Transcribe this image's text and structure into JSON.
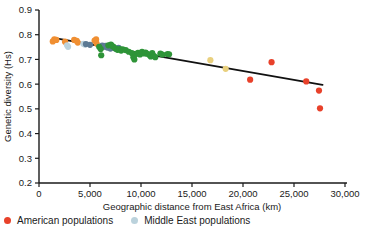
{
  "chart_data": {
    "type": "scatter",
    "title": "",
    "xlabel": "Geographic distance from East Africa (km)",
    "ylabel": "Genetic diversity (Hs)",
    "xlim": [
      0,
      30000
    ],
    "ylim": [
      0.2,
      0.9
    ],
    "grid": false,
    "legend_position": "bottom-left",
    "xticks": [
      0,
      5000,
      10000,
      15000,
      20000,
      25000,
      30000
    ],
    "xtick_labels": [
      "0",
      "5,000",
      "10,000",
      "15,000",
      "20,000",
      "25,000",
      "30,000"
    ],
    "yticks": [
      0.2,
      0.3,
      0.4,
      0.5,
      0.6,
      0.7,
      0.8,
      0.9
    ],
    "ytick_labels": [
      "0.2",
      "0.3",
      "0.4",
      "0.5",
      "0.6",
      "0.7",
      "0.8",
      "0.9"
    ],
    "trendline": {
      "name": "linear regression",
      "color": "#111111",
      "x": [
        1400,
        27800
      ],
      "y": [
        0.787,
        0.597
      ]
    },
    "series": [
      {
        "name": "African populations",
        "color": "#F08F32",
        "points": [
          [
            1350,
            0.773
          ],
          [
            1500,
            0.781
          ],
          [
            1700,
            0.779
          ],
          [
            2550,
            0.772
          ],
          [
            3450,
            0.779
          ],
          [
            3700,
            0.775
          ],
          [
            3800,
            0.768
          ],
          [
            5450,
            0.776
          ],
          [
            5600,
            0.781
          ],
          [
            5650,
            0.764
          ]
        ]
      },
      {
        "name": "Middle East populations",
        "color": "#BBD2DC",
        "points": [
          [
            2750,
            0.757
          ],
          [
            2850,
            0.751
          ],
          [
            4350,
            0.763
          ],
          [
            4500,
            0.76
          ]
        ]
      },
      {
        "name": "European populations",
        "color": "#5C7A94",
        "points": [
          [
            4600,
            0.762
          ],
          [
            5000,
            0.759
          ],
          [
            6200,
            0.756
          ],
          [
            6350,
            0.751
          ],
          [
            6500,
            0.755
          ],
          [
            6700,
            0.748
          ],
          [
            6900,
            0.752
          ],
          [
            7000,
            0.744
          ],
          [
            7200,
            0.749
          ],
          [
            7400,
            0.746
          ],
          [
            7600,
            0.742
          ],
          [
            7800,
            0.747
          ]
        ]
      },
      {
        "name": "Asian populations",
        "color": "#2E9438",
        "points": [
          [
            5900,
            0.751
          ],
          [
            6050,
            0.742
          ],
          [
            6100,
            0.717
          ],
          [
            6800,
            0.757
          ],
          [
            7050,
            0.76
          ],
          [
            7150,
            0.755
          ],
          [
            7300,
            0.751
          ],
          [
            7500,
            0.744
          ],
          [
            7700,
            0.739
          ],
          [
            7900,
            0.742
          ],
          [
            8050,
            0.736
          ],
          [
            8200,
            0.741
          ],
          [
            8500,
            0.738
          ],
          [
            8800,
            0.731
          ],
          [
            9100,
            0.726
          ],
          [
            9250,
            0.709
          ],
          [
            9350,
            0.7
          ],
          [
            9500,
            0.722
          ],
          [
            9700,
            0.727
          ],
          [
            9900,
            0.72
          ],
          [
            10100,
            0.731
          ],
          [
            10300,
            0.724
          ],
          [
            10450,
            0.728
          ],
          [
            10600,
            0.723
          ],
          [
            10800,
            0.719
          ],
          [
            10950,
            0.712
          ],
          [
            11100,
            0.726
          ],
          [
            11250,
            0.714
          ],
          [
            11400,
            0.709
          ],
          [
            11900,
            0.724
          ],
          [
            12100,
            0.72
          ],
          [
            12600,
            0.722
          ],
          [
            12750,
            0.721
          ]
        ]
      },
      {
        "name": "Oceanian populations",
        "color": "#E9D07E",
        "points": [
          [
            16800,
            0.697
          ],
          [
            18300,
            0.662
          ]
        ]
      },
      {
        "name": "American populations",
        "color": "#E8412A",
        "points": [
          [
            20700,
            0.618
          ],
          [
            22800,
            0.689
          ],
          [
            26200,
            0.611
          ],
          [
            27450,
            0.574
          ],
          [
            27550,
            0.502
          ]
        ]
      }
    ]
  },
  "legend": {
    "entries": [
      {
        "label": "American populations",
        "color": "#E8412A"
      },
      {
        "label": "Middle East populations",
        "color": "#BBD2DC"
      }
    ]
  },
  "geometry": {
    "plot_left": 39,
    "plot_right": 345,
    "plot_top": 10,
    "plot_bottom": 183
  }
}
